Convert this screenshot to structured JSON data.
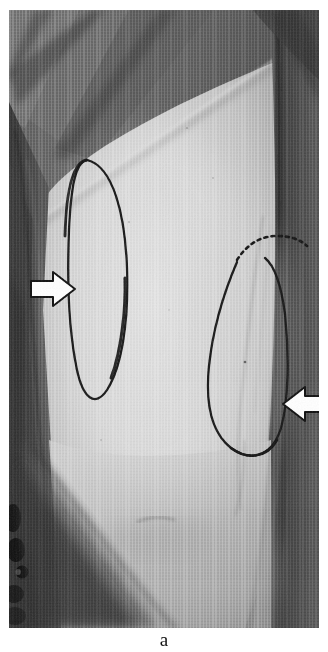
{
  "figure": {
    "panel_label": "a",
    "caption_visible": false,
    "modality": "clinical-photograph",
    "background_color": "#ffffff",
    "photo": {
      "x": 9,
      "y": 10,
      "width": 310,
      "height": 618,
      "tone": "grayscale",
      "colors": {
        "drape_dark": "#4c4c4c",
        "drape_mid": "#6e6e6e",
        "skin_light": "#cfcfcf",
        "skin_highlight": "#dcdcdc",
        "skin_shadow": "#9a9a9a",
        "edge_dark": "#2a2a2a",
        "ink_marking": "#1a1a1a",
        "arrow_fill": "#ffffff",
        "arrow_stroke": "#101010"
      }
    },
    "annotations": [
      {
        "name": "left-arrow",
        "type": "arrow",
        "direction": "right",
        "fill": "#ffffff",
        "stroke": "#101010",
        "tip_x": 63,
        "tip_y": 290,
        "points_to": "left skin marking outline"
      },
      {
        "name": "right-arrow",
        "type": "arrow",
        "direction": "left",
        "fill": "#ffffff",
        "stroke": "#101010",
        "tip_x": 283,
        "tip_y": 404,
        "points_to": "right skin marking outline"
      }
    ],
    "markings": [
      {
        "name": "left-skin-marking",
        "shape": "elongated-oval",
        "style": "solid-ink-line",
        "color": "#1a1a1a",
        "center_x": 78,
        "center_y": 265,
        "rx": 28,
        "ry": 115
      },
      {
        "name": "right-skin-marking",
        "shape": "teardrop-oval",
        "style": "solid-ink-line-with-dashed-superior-arc",
        "color": "#1a1a1a",
        "center_x": 252,
        "center_y": 340,
        "rx": 42,
        "ry": 105
      }
    ]
  }
}
